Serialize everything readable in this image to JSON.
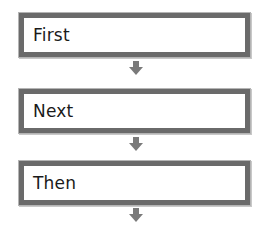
{
  "diagram": {
    "type": "vertical-flowchart",
    "colors": {
      "border": "#6a6a6a",
      "arrow": "#7a7a7a",
      "background": "#ffffff",
      "text": "#1a1a1a"
    },
    "steps": [
      {
        "label": "First"
      },
      {
        "label": "Next"
      },
      {
        "label": "Then"
      }
    ],
    "arrows": [
      {
        "from": "First",
        "to": "Next"
      },
      {
        "from": "Next",
        "to": "Then"
      },
      {
        "from": "Then",
        "to": ""
      }
    ]
  }
}
